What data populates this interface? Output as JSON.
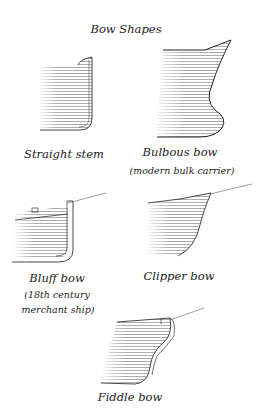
{
  "title": "Bow Shapes",
  "figures": [
    {
      "name": "Straight stem",
      "subtitle": []
    },
    {
      "name": "Bulbous bow",
      "subtitle": [
        "(modern bulk carrier)"
      ]
    },
    {
      "name": "Bluff bow",
      "subtitle": [
        "(18th century",
        "merchant ship)"
      ]
    },
    {
      "name": "Clipper bow",
      "subtitle": []
    },
    {
      "name": "Fiddle bow",
      "subtitle": []
    }
  ],
  "colors": {
    "ink": "#333333",
    "hatch": "#888888",
    "background": "#ffffff"
  }
}
